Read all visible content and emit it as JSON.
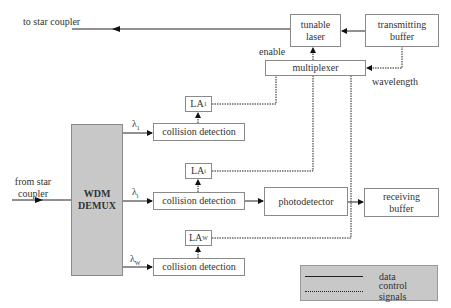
{
  "labels": {
    "to_star_coupler": "to star coupler",
    "from_star_coupler_line1": "from star",
    "from_star_coupler_line2": "coupler",
    "enable": "enable",
    "wavelength": "wavelength",
    "lambda_1": "λ",
    "lambda_1_sub": "1",
    "lambda_i": "λ",
    "lambda_i_sub": "i",
    "lambda_w": "λ",
    "lambda_w_sub": "W"
  },
  "blocks": {
    "tunable_laser": {
      "line1": "tunable",
      "line2": "laser"
    },
    "transmitting_buffer": {
      "line1": "transmitting",
      "line2": "buffer"
    },
    "multiplexer": "multiplexer",
    "wdm_demux": {
      "line1": "WDM",
      "line2": "DEMUX"
    },
    "collision_detection_1": "collision detection",
    "collision_detection_i": "collision detection",
    "collision_detection_w": "collision detection",
    "la_1": {
      "text": "LA",
      "sub": "1"
    },
    "la_i": {
      "text": "LA",
      "sub": "i"
    },
    "la_w": {
      "text": "LA",
      "sub": "W"
    },
    "photodetector": "photodetector",
    "receiving_buffer": {
      "line1": "receiving",
      "line2": "buffer"
    }
  },
  "legend": {
    "data": "data",
    "control_signals": "control signals"
  },
  "colors": {
    "demux_fill": "#c8c8c8",
    "legend_fill": "#c8c8c8",
    "line": "#222222",
    "box_border": "#8a8a8a"
  }
}
